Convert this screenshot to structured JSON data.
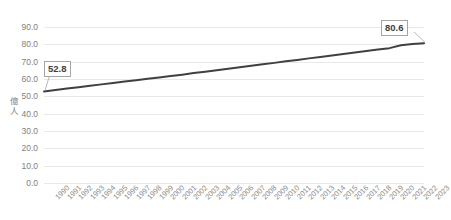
{
  "chart_data": {
    "type": "line",
    "title": "",
    "xlabel": "",
    "ylabel": "億人",
    "ylim": [
      0.0,
      90.0
    ],
    "ytick_step": 10.0,
    "grid": true,
    "legend": false,
    "line_color": "#404040",
    "gridline_color": "#e8e8e8",
    "tick_label_color": "#7f7f7f",
    "ytick_labels": [
      "90.0",
      "80.0",
      "70.0",
      "60.0",
      "50.0",
      "40.0",
      "30.0",
      "20.0",
      "10.0",
      "0.0"
    ],
    "ytick_values": [
      90.0,
      80.0,
      70.0,
      60.0,
      50.0,
      40.0,
      30.0,
      20.0,
      10.0,
      0.0
    ],
    "categories": [
      "1990",
      "1991",
      "1992",
      "1993",
      "1994",
      "1995",
      "1996",
      "1997",
      "1998",
      "1999",
      "2000",
      "2001",
      "2002",
      "2003",
      "2004",
      "2005",
      "2006",
      "2007",
      "2008",
      "2009",
      "2010",
      "2011",
      "2012",
      "2013",
      "2014",
      "2015",
      "2016",
      "2017",
      "2018",
      "2019",
      "2020",
      "2021",
      "2022",
      "2023"
    ],
    "values": [
      52.8,
      53.7,
      54.5,
      55.3,
      56.1,
      56.9,
      57.7,
      58.5,
      59.3,
      60.1,
      60.9,
      61.7,
      62.5,
      63.4,
      64.2,
      65.1,
      65.9,
      66.8,
      67.6,
      68.5,
      69.3,
      70.2,
      71.0,
      71.9,
      72.7,
      73.6,
      74.4,
      75.3,
      76.1,
      77.0,
      77.8,
      79.5,
      80.2,
      80.6
    ],
    "annotations": [
      {
        "name": "start-value",
        "label": "52.8",
        "category": "1990",
        "value": 52.8
      },
      {
        "name": "end-value",
        "label": "80.6",
        "category": "2023",
        "value": 80.6
      }
    ]
  }
}
